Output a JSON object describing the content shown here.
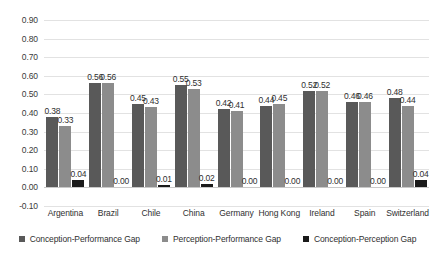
{
  "chart_data": {
    "type": "bar",
    "title": "",
    "xlabel": "",
    "ylabel": "",
    "ylim": [
      -0.1,
      0.9
    ],
    "ytick_step": 0.1,
    "grid": true,
    "legend_position": "bottom",
    "categories": [
      "Argentina",
      "Brazil",
      "Chile",
      "China",
      "Germany",
      "Hong Kong",
      "Ireland",
      "Spain",
      "Switzerland"
    ],
    "ytick_labels": [
      "0.90",
      "0.80",
      "0.70",
      "0.60",
      "0.50",
      "0.40",
      "0.30",
      "0.20",
      "0.10",
      "0.00",
      "-0.10"
    ],
    "series": [
      {
        "name": "Conception-Performance Gap",
        "color": "#595959",
        "values": [
          0.38,
          0.56,
          0.45,
          0.55,
          0.42,
          0.44,
          0.52,
          0.46,
          0.48
        ],
        "labels": [
          "0.38",
          "0.56",
          "0.45",
          "0.55",
          "0.42",
          "0.44",
          "0.52",
          "0.46",
          "0.48"
        ]
      },
      {
        "name": "Perception-Performance Gap",
        "color": "#8c8c8c",
        "values": [
          0.33,
          0.56,
          0.43,
          0.53,
          0.41,
          0.45,
          0.52,
          0.46,
          0.44
        ],
        "labels": [
          "0.33",
          "0.56",
          "0.43",
          "0.53",
          "0.41",
          "0.45",
          "0.52",
          "0.46",
          "0.44"
        ]
      },
      {
        "name": "Conception-Perception Gap",
        "color": "#1a1a1a",
        "values": [
          0.04,
          0.0,
          0.01,
          0.02,
          0.0,
          0.0,
          0.0,
          0.0,
          0.04
        ],
        "labels": [
          "0.04",
          "0.00",
          "0.01",
          "0.02",
          "0.00",
          "0.00",
          "0.00",
          "0.00",
          "0.04"
        ]
      }
    ]
  },
  "legend": {
    "items": [
      {
        "label": "Conception-Performance Gap"
      },
      {
        "label": "Perception-Performance Gap"
      },
      {
        "label": "Conception-Perception Gap"
      }
    ]
  }
}
